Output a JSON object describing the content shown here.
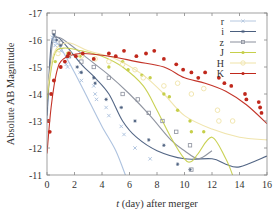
{
  "chart_data": {
    "type": "scatter",
    "title": "",
    "xlabel": "t (day) after merger",
    "xlabel_italic": "t",
    "xlabel_rest": " (day) after merger",
    "ylabel": "Absolute AB Magnitude",
    "xlim": [
      0,
      16
    ],
    "ylim": [
      -11,
      -17
    ],
    "y_inverted": true,
    "xticks": [
      "0",
      "2",
      "4",
      "6",
      "8",
      "10",
      "12",
      "14",
      "16"
    ],
    "yticks": [
      "-17",
      "-16",
      "-15",
      "-14",
      "-13",
      "-12",
      "-11"
    ],
    "grid": false,
    "legend_position": "upper right",
    "legend": [
      {
        "label": "r",
        "color": "#b6c8e0",
        "marker": "x"
      },
      {
        "label": "i",
        "color": "#4a5e7e",
        "marker": "star"
      },
      {
        "label": "z",
        "color": "#8a8f9c",
        "marker": "square-open"
      },
      {
        "label": "J",
        "color": "#c6cf4a",
        "marker": "circle"
      },
      {
        "label": "H",
        "color": "#efe3a8",
        "marker": "circle-open"
      },
      {
        "label": "K",
        "color": "#c0281c",
        "marker": "circle"
      }
    ],
    "series": [
      {
        "name": "r",
        "color": "#a9bfdd",
        "points": [
          [
            0.4,
            -16.1
          ],
          [
            0.5,
            -16.0
          ],
          [
            0.6,
            -15.8
          ],
          [
            1.0,
            -15.6
          ],
          [
            1.4,
            -15.1
          ],
          [
            1.5,
            -15.0
          ],
          [
            2.4,
            -14.8
          ],
          [
            2.5,
            -14.5
          ],
          [
            3.4,
            -14.3
          ],
          [
            3.5,
            -14.0
          ],
          [
            3.6,
            -13.8
          ],
          [
            4.3,
            -13.5
          ],
          [
            4.5,
            -13.2
          ],
          [
            5.4,
            -12.8
          ],
          [
            5.6,
            -12.5
          ],
          [
            6.4,
            -12.0
          ],
          [
            7.5,
            -11.6
          ]
        ],
        "curve": [
          [
            0,
            -13.0
          ],
          [
            0.3,
            -15.6
          ],
          [
            0.6,
            -15.9
          ],
          [
            1.0,
            -15.7
          ],
          [
            2.0,
            -14.8
          ],
          [
            3.0,
            -13.8
          ],
          [
            4.0,
            -12.8
          ],
          [
            5.0,
            -11.9
          ],
          [
            5.7,
            -11.0
          ]
        ]
      },
      {
        "name": "i",
        "color": "#4a5e7e",
        "points": [
          [
            0.5,
            -16.2
          ],
          [
            0.7,
            -16.0
          ],
          [
            1.0,
            -15.8
          ],
          [
            1.5,
            -15.4
          ],
          [
            2.2,
            -15.0
          ],
          [
            2.5,
            -14.8
          ],
          [
            3.4,
            -14.6
          ],
          [
            3.5,
            -14.4
          ],
          [
            4.3,
            -13.8
          ],
          [
            5.4,
            -13.5
          ],
          [
            6.4,
            -13.0
          ],
          [
            7.4,
            -12.3
          ],
          [
            8.5,
            -12.1
          ],
          [
            9.5,
            -11.4
          ],
          [
            10.4,
            -11.2
          ]
        ],
        "curve": [
          [
            0,
            -13.2
          ],
          [
            0.3,
            -15.8
          ],
          [
            0.7,
            -16.1
          ],
          [
            1.2,
            -15.9
          ],
          [
            2.5,
            -15.1
          ],
          [
            3.5,
            -14.6
          ],
          [
            4.5,
            -14.0
          ],
          [
            5.5,
            -13.0
          ],
          [
            6.5,
            -12.4
          ],
          [
            8.0,
            -11.9
          ],
          [
            10.0,
            -11.6
          ],
          [
            12.0,
            -11.6
          ],
          [
            13.0,
            -11.4
          ],
          [
            14.0,
            -11.3
          ],
          [
            16.0,
            -11.7
          ]
        ]
      },
      {
        "name": "z",
        "color": "#8a8f9c",
        "points": [
          [
            0.5,
            -16.3
          ],
          [
            1.0,
            -15.9
          ],
          [
            1.6,
            -15.4
          ],
          [
            2.5,
            -15.2
          ],
          [
            3.4,
            -15.0
          ],
          [
            4.5,
            -14.6
          ],
          [
            5.5,
            -14.0
          ],
          [
            6.6,
            -13.8
          ],
          [
            7.4,
            -13.3
          ],
          [
            8.4,
            -13.0
          ],
          [
            9.4,
            -12.6
          ],
          [
            10.4,
            -12.1
          ],
          [
            10.5,
            -11.2
          ]
        ],
        "curve": [
          [
            0,
            -13.5
          ],
          [
            0.4,
            -15.9
          ],
          [
            0.8,
            -16.1
          ],
          [
            1.5,
            -15.9
          ],
          [
            3.0,
            -15.3
          ],
          [
            4.5,
            -14.7
          ],
          [
            6.0,
            -14.0
          ],
          [
            7.5,
            -13.2
          ],
          [
            9.0,
            -12.3
          ],
          [
            10.0,
            -11.9
          ],
          [
            11.0,
            -11.6
          ],
          [
            12.0,
            -11.9
          ]
        ]
      },
      {
        "name": "J",
        "color": "#c6cf4a",
        "points": [
          [
            0.6,
            -15.2
          ],
          [
            1.5,
            -15.5
          ],
          [
            2.4,
            -15.4
          ],
          [
            3.4,
            -15.3
          ],
          [
            4.5,
            -15.0
          ],
          [
            5.5,
            -15.2
          ],
          [
            5.9,
            -14.9
          ],
          [
            6.9,
            -14.7
          ],
          [
            7.5,
            -14.6
          ],
          [
            8.5,
            -14.0
          ],
          [
            8.9,
            -13.9
          ],
          [
            9.5,
            -13.4
          ],
          [
            10.4,
            -13.0
          ],
          [
            10.5,
            -12.6
          ],
          [
            11.4,
            -12.6
          ]
        ],
        "curve": [
          [
            0,
            -13.8
          ],
          [
            0.5,
            -15.4
          ],
          [
            1.2,
            -15.7
          ],
          [
            2.5,
            -15.6
          ],
          [
            4.0,
            -15.4
          ],
          [
            5.5,
            -15.0
          ],
          [
            7.0,
            -14.3
          ],
          [
            8.0,
            -13.4
          ],
          [
            9.0,
            -12.4
          ],
          [
            10.0,
            -11.6
          ],
          [
            10.5,
            -11.5
          ],
          [
            11.0,
            -11.8
          ],
          [
            12.0,
            -12.4
          ],
          [
            13.0,
            -11.6
          ],
          [
            13.5,
            -11.0
          ]
        ]
      },
      {
        "name": "H",
        "color": "#efe3a8",
        "points": [
          [
            0.8,
            -15.5
          ],
          [
            1.6,
            -15.5
          ],
          [
            2.5,
            -15.4
          ],
          [
            3.5,
            -15.3
          ],
          [
            4.5,
            -15.2
          ],
          [
            5.5,
            -15.1
          ],
          [
            6.4,
            -14.9
          ],
          [
            7.0,
            -14.6
          ],
          [
            8.5,
            -14.3
          ],
          [
            9.5,
            -14.4
          ],
          [
            10.5,
            -14.0
          ],
          [
            11.4,
            -14.2
          ],
          [
            12.4,
            -13.4
          ],
          [
            12.5,
            -13.0
          ],
          [
            13.5,
            -13.0
          ]
        ],
        "curve": [
          [
            0,
            -14.0
          ],
          [
            0.5,
            -15.5
          ],
          [
            1.5,
            -15.9
          ],
          [
            3.0,
            -15.6
          ],
          [
            5.0,
            -15.3
          ],
          [
            7.0,
            -14.7
          ],
          [
            8.5,
            -14.0
          ],
          [
            10.0,
            -13.2
          ],
          [
            12.0,
            -12.7
          ],
          [
            14.0,
            -12.4
          ],
          [
            16.0,
            -12.3
          ]
        ]
      },
      {
        "name": "K",
        "color": "#c0281c",
        "points": [
          [
            0.1,
            -13.0
          ],
          [
            0.2,
            -12.6
          ],
          [
            0.3,
            -14.0
          ],
          [
            0.5,
            -14.5
          ],
          [
            1.0,
            -15.0
          ],
          [
            1.3,
            -15.2
          ],
          [
            1.5,
            -15.4
          ],
          [
            1.6,
            -15.5
          ],
          [
            2.1,
            -15.4
          ],
          [
            2.6,
            -15.5
          ],
          [
            3.4,
            -15.3
          ],
          [
            4.5,
            -15.5
          ],
          [
            5.0,
            -15.4
          ],
          [
            5.6,
            -15.6
          ],
          [
            6.5,
            -15.4
          ],
          [
            7.2,
            -15.5
          ],
          [
            7.8,
            -15.6
          ],
          [
            8.5,
            -15.3
          ],
          [
            9.4,
            -15.1
          ],
          [
            9.9,
            -14.9
          ],
          [
            10.5,
            -14.8
          ],
          [
            11.0,
            -14.6
          ],
          [
            11.5,
            -14.8
          ],
          [
            12.5,
            -14.6
          ],
          [
            12.9,
            -14.4
          ],
          [
            13.4,
            -14.3
          ],
          [
            14.4,
            -14.0
          ],
          [
            14.5,
            -13.8
          ],
          [
            15.4,
            -13.7
          ],
          [
            15.5,
            -13.5
          ],
          [
            15.6,
            -13.3
          ]
        ],
        "curve": [
          [
            0,
            -11.8
          ],
          [
            0.3,
            -13.5
          ],
          [
            0.7,
            -14.8
          ],
          [
            1.2,
            -15.3
          ],
          [
            2.5,
            -15.5
          ],
          [
            4.5,
            -15.4
          ],
          [
            6.5,
            -15.2
          ],
          [
            8.5,
            -15.0
          ],
          [
            10.0,
            -14.6
          ],
          [
            11.5,
            -14.4
          ],
          [
            13.0,
            -14.1
          ],
          [
            14.5,
            -13.6
          ],
          [
            16.0,
            -12.9
          ]
        ]
      }
    ]
  }
}
